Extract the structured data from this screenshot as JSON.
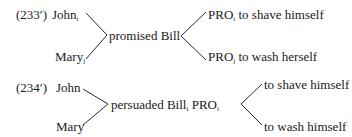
{
  "examples": [
    {
      "label": "(233′)",
      "subjects": [
        {
          "name": "John",
          "index": "i"
        },
        {
          "name": "Mary",
          "index": "j"
        }
      ],
      "verb_phrase": {
        "verb": "promised",
        "object": "Bill",
        "object_index": "",
        "pro": "",
        "pro_index": ""
      },
      "complements": [
        {
          "pro": "PRO",
          "index": "i",
          "text": "to shave himself"
        },
        {
          "pro": "PRO",
          "index": "j",
          "text": "to wash herself"
        }
      ]
    },
    {
      "label": "(234′)",
      "subjects": [
        {
          "name": "John",
          "index": ""
        },
        {
          "name": "Mary",
          "index": ""
        }
      ],
      "verb_phrase": {
        "verb": "persuaded",
        "object": "Bill",
        "object_index": "i",
        "pro": "PRO",
        "pro_index": "i"
      },
      "complements": [
        {
          "pro": "",
          "index": "",
          "text": "to shave himself"
        },
        {
          "pro": "",
          "index": "",
          "text": "to wash himself"
        }
      ]
    }
  ],
  "colors": {
    "text": "#1a1a1a",
    "lines": "#2a2a2a",
    "background": "#ffffff"
  }
}
